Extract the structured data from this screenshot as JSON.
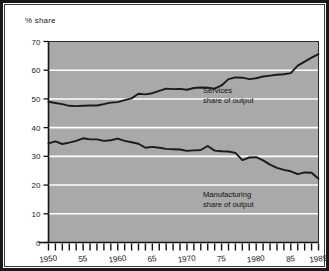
{
  "figure": {
    "y_axis_caption": "% share",
    "background_color": "#ffffff",
    "plot_fill_color": "#a9a9a9",
    "gridline_color": "#ffffff",
    "line_color": "#1a1a1a",
    "border_color": "#18181a"
  },
  "annotations": {
    "services": {
      "line1": "Services",
      "line2": "share of output"
    },
    "manufacturing": {
      "line1": "Manufacturing",
      "line2": "share of output"
    }
  },
  "chart_data": {
    "type": "line",
    "title": "",
    "subtitle": "",
    "xlabel": "",
    "ylabel": "% share",
    "xlim": [
      1950,
      1989
    ],
    "ylim": [
      0,
      70
    ],
    "yticks": [
      0,
      10,
      20,
      30,
      40,
      50,
      60,
      70
    ],
    "ytick_labels": [
      "0",
      "10",
      "20",
      "30",
      "40",
      "50",
      "60",
      "70"
    ],
    "grid": true,
    "grid_axis": "y",
    "legend": "inline-annotations",
    "xticks_every": 1,
    "xtick_labels": [
      {
        "year": 1950,
        "label": "1950"
      },
      {
        "year": 1955,
        "label": "55"
      },
      {
        "year": 1960,
        "label": "1960"
      },
      {
        "year": 1965,
        "label": "65"
      },
      {
        "year": 1970,
        "label": "1970"
      },
      {
        "year": 1975,
        "label": "75"
      },
      {
        "year": 1980,
        "label": "1980"
      },
      {
        "year": 1985,
        "label": "85"
      },
      {
        "year": 1989,
        "label": "1989"
      }
    ],
    "x": [
      1950,
      1951,
      1952,
      1953,
      1954,
      1955,
      1956,
      1957,
      1958,
      1959,
      1960,
      1961,
      1962,
      1963,
      1964,
      1965,
      1966,
      1967,
      1968,
      1969,
      1970,
      1971,
      1972,
      1973,
      1974,
      1975,
      1976,
      1977,
      1978,
      1979,
      1980,
      1981,
      1982,
      1983,
      1984,
      1985,
      1986,
      1987,
      1988,
      1989
    ],
    "series": [
      {
        "name": "Services share of output",
        "values": [
          49.0,
          48.6,
          48.2,
          47.6,
          47.5,
          47.6,
          47.7,
          47.7,
          48.2,
          48.7,
          48.9,
          49.6,
          50.2,
          51.8,
          51.6,
          52.0,
          52.8,
          53.6,
          53.4,
          53.5,
          53.2,
          53.8,
          54.0,
          53.9,
          53.6,
          54.7,
          56.9,
          57.5,
          57.4,
          56.9,
          57.2,
          57.8,
          58.1,
          58.4,
          58.6,
          59.0,
          61.6,
          63.0,
          64.4,
          65.6
        ]
      },
      {
        "name": "Manufacturing share of output",
        "values": [
          34.5,
          35.2,
          34.3,
          34.8,
          35.4,
          36.3,
          35.9,
          35.9,
          35.4,
          35.6,
          36.2,
          35.4,
          34.9,
          34.4,
          33.0,
          33.3,
          33.0,
          32.6,
          32.5,
          32.4,
          31.9,
          32.1,
          32.2,
          33.6,
          32.0,
          31.8,
          31.7,
          31.2,
          28.7,
          29.6,
          29.7,
          28.6,
          27.1,
          26.0,
          25.3,
          24.8,
          23.8,
          24.4,
          24.3,
          22.2
        ]
      }
    ]
  }
}
